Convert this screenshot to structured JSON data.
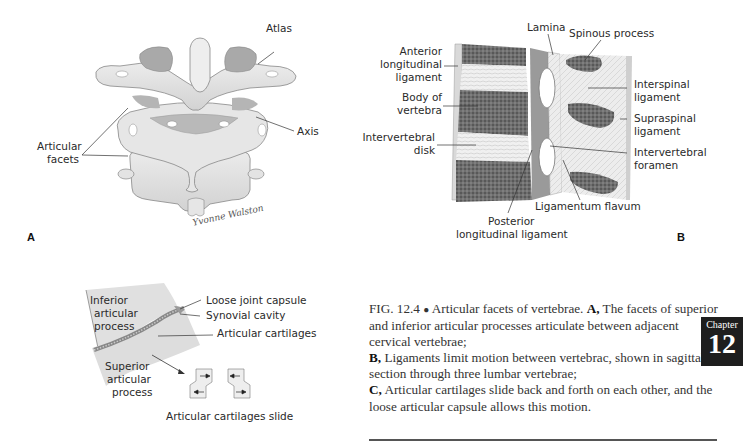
{
  "figure": {
    "panel_a": {
      "letter": "A",
      "labels": {
        "atlas": "Atlas",
        "axis": "Axis",
        "articular_facets_1": "Articular",
        "articular_facets_2": "facets"
      },
      "signature": "Yvonne Walston"
    },
    "panel_b": {
      "letter": "B",
      "labels": {
        "lamina": "Lamina",
        "spinous_process": "Spinous process",
        "anterior_1": "Anterior",
        "anterior_2": "longitudinal",
        "anterior_3": "ligament",
        "body_1": "Body of",
        "body_2": "vertebra",
        "disk_1": "Intervertebral",
        "disk_2": "disk",
        "interspinal_1": "Interspinal",
        "interspinal_2": "ligament",
        "supraspinal_1": "Supraspinal",
        "supraspinal_2": "ligament",
        "foramen_1": "Intervertebral",
        "foramen_2": "foramen",
        "flavum": "Ligamentum flavum",
        "posterior_1": "Posterior",
        "posterior_2": "longitudinal ligament"
      }
    },
    "panel_c": {
      "labels": {
        "inferior_1": "Inferior",
        "inferior_2": "articular",
        "inferior_3": "process",
        "capsule": "Loose joint capsule",
        "synovial": "Synovial cavity",
        "cartilages": "Articular cartilages",
        "superior_1": "Superior",
        "superior_2": "articular",
        "superior_3": "process",
        "slide": "Articular cartilages slide"
      }
    }
  },
  "caption": {
    "fig_number": "FIG. 12.4",
    "bullet": "●",
    "title": "Articular facets of vertebrae.",
    "a_label": "A,",
    "a_text": "The facets of superior and inferior articular processes articulate between adjacent cervical vertebrae;",
    "b_label": "B,",
    "b_text": "Ligaments limit motion between vertebrac, shown in sagittal section through three lumbar vertebrae;",
    "c_label": "C,",
    "c_text": "Articular cartilages slide back and forth on each other, and the loose articular capsule allows this motion."
  },
  "chapter_tab": {
    "label": "Chapter",
    "number": "12"
  }
}
